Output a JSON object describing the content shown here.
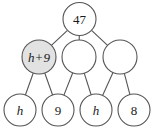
{
  "diagram": {
    "type": "number-pyramid-tree",
    "background_color": "#ffffff",
    "stroke_color": "#555555",
    "shaded_fill_color": "#e2e2e2",
    "node_fill_color": "#ffffff",
    "text_color": "#1a1a1a",
    "levels": [
      {
        "level": 0,
        "nodes": [
          {
            "id": "top",
            "label": "47",
            "italic": false,
            "shaded": false,
            "cx": 79.5,
            "cy": 19,
            "r": 16.5
          }
        ]
      },
      {
        "level": 1,
        "nodes": [
          {
            "id": "mid-left",
            "label": "h+9",
            "italic": true,
            "shaded": true,
            "cx": 39,
            "cy": 57,
            "r": 17
          },
          {
            "id": "mid-center",
            "label": "",
            "italic": false,
            "shaded": false,
            "cx": 79,
            "cy": 57,
            "r": 17
          },
          {
            "id": "mid-right",
            "label": "",
            "italic": false,
            "shaded": false,
            "cx": 120,
            "cy": 57,
            "r": 17
          }
        ]
      },
      {
        "level": 2,
        "nodes": [
          {
            "id": "bot-1",
            "label": "h",
            "italic": true,
            "shaded": false,
            "cx": 20,
            "cy": 110,
            "r": 16
          },
          {
            "id": "bot-2",
            "label": "9",
            "italic": false,
            "shaded": false,
            "cx": 58,
            "cy": 110,
            "r": 16
          },
          {
            "id": "bot-3",
            "label": "h",
            "italic": true,
            "shaded": false,
            "cx": 96,
            "cy": 110,
            "r": 16
          },
          {
            "id": "bot-4",
            "label": "8",
            "italic": false,
            "shaded": false,
            "cx": 134,
            "cy": 110,
            "r": 16
          }
        ]
      }
    ],
    "edges": [
      {
        "from": "top",
        "to": "mid-left"
      },
      {
        "from": "top",
        "to": "mid-center"
      },
      {
        "from": "top",
        "to": "mid-right"
      },
      {
        "from": "mid-left",
        "to": "bot-1"
      },
      {
        "from": "mid-left",
        "to": "bot-2"
      },
      {
        "from": "mid-center",
        "to": "bot-2"
      },
      {
        "from": "mid-center",
        "to": "bot-3"
      },
      {
        "from": "mid-right",
        "to": "bot-3"
      },
      {
        "from": "mid-right",
        "to": "bot-4"
      }
    ]
  }
}
